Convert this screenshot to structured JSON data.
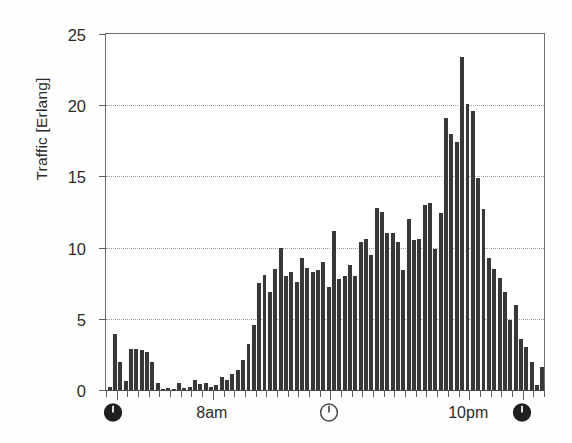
{
  "chart_data": {
    "type": "bar",
    "title": "",
    "subtitle": "",
    "xlabel": "",
    "ylabel": "Traffic [Erlang]",
    "ylim": [
      0,
      25
    ],
    "yticks": [
      0,
      5,
      10,
      15,
      20,
      25
    ],
    "ytick_labels": [
      "0",
      "5",
      "10",
      "15",
      "20",
      "25"
    ],
    "grid": "horizontal-dotted",
    "legend": "none",
    "bar_color": "#383838",
    "axis_color": "#5f5f5f",
    "grid_color": "#9a9a9a",
    "x_axis_kind": "time-of-day",
    "x_tick_labels": [
      "8am",
      "10pm"
    ],
    "x_tick_label_positions": [
      20,
      68
    ],
    "x_icon_markers": [
      {
        "name": "clock-icon-midnight-start",
        "style": "filled",
        "position": 1.5
      },
      {
        "name": "clock-icon-noon",
        "style": "outline",
        "position": 42
      },
      {
        "name": "clock-icon-midnight-end",
        "style": "filled",
        "position": 78
      }
    ],
    "n_bars": 82,
    "xlim": [
      0,
      82
    ],
    "values": [
      0.2,
      3.9,
      2.0,
      0.6,
      2.9,
      2.9,
      2.8,
      2.7,
      2.0,
      0.5,
      0.1,
      0.15,
      0.1,
      0.5,
      0.15,
      0.2,
      0.7,
      0.45,
      0.5,
      0.2,
      0.35,
      0.9,
      0.7,
      1.1,
      1.4,
      2.1,
      3.2,
      4.6,
      7.5,
      8.1,
      6.9,
      8.5,
      9.95,
      8.0,
      8.3,
      7.6,
      9.3,
      8.6,
      8.3,
      8.4,
      9.0,
      7.2,
      11.2,
      7.8,
      8.0,
      8.8,
      8.0,
      10.4,
      10.6,
      9.5,
      12.8,
      12.5,
      11.0,
      11.0,
      10.4,
      8.4,
      12.0,
      10.5,
      10.6,
      13.0,
      13.1,
      9.9,
      12.4,
      19.1,
      18.0,
      17.4,
      23.4,
      20.1,
      19.6,
      14.9,
      12.7,
      9.3,
      8.5,
      7.9,
      6.9,
      4.9,
      6.0,
      3.6,
      3.0,
      2.0,
      0.35,
      1.6
    ]
  }
}
